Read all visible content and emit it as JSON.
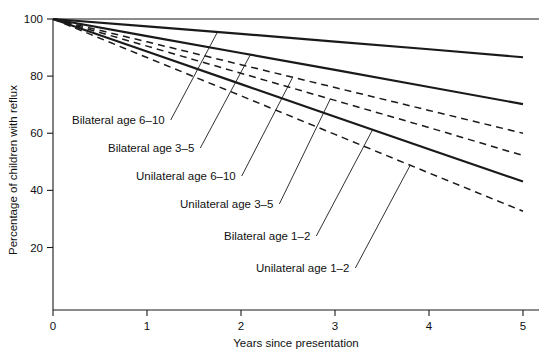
{
  "chart_data": {
    "type": "line",
    "title": "",
    "xlabel": "Years since presentation",
    "ylabel": "Percentage of children with reflux",
    "xlim": [
      0,
      5
    ],
    "ylim": [
      0,
      100
    ],
    "xticks": [
      "0",
      "1",
      "2",
      "3",
      "4",
      "5"
    ],
    "xtick_values": [
      0,
      1,
      2,
      3,
      4,
      5
    ],
    "yticks": [
      "20",
      "40",
      "60",
      "80",
      "100"
    ],
    "ytick_values": [
      20,
      40,
      60,
      80,
      100
    ],
    "grid": false,
    "legend_position": "inline-labels",
    "x": [
      0,
      1,
      2,
      3,
      4,
      5
    ],
    "series": [
      {
        "name": "Bilateral age 6-10",
        "label": "Bilateral age 6–10",
        "style": "solid",
        "color": "#1a1a1a",
        "values": [
          100,
          97.4,
          94.8,
          92.1,
          89.4,
          86.6
        ]
      },
      {
        "name": "Bilateral age 3-5",
        "label": "Bilateral age 3–5",
        "style": "solid",
        "color": "#1a1a1a",
        "values": [
          100,
          94.0,
          88.1,
          82.2,
          76.2,
          70.2
        ]
      },
      {
        "name": "Unilateral age 6-10",
        "label": "Unilateral age 6–10",
        "style": "dashed",
        "color": "#1a1a1a",
        "values": [
          100,
          92.0,
          84.0,
          76.0,
          68.0,
          60.0
        ]
      },
      {
        "name": "Unilateral age 3-5",
        "label": "Unilateral age 3–5",
        "style": "dashed",
        "color": "#1a1a1a",
        "values": [
          100,
          90.5,
          81.0,
          71.5,
          62.0,
          52.2
        ]
      },
      {
        "name": "Bilateral age 1-2",
        "label": "Bilateral age 1–2",
        "style": "solid",
        "color": "#1a1a1a",
        "values": [
          100,
          88.6,
          77.2,
          65.8,
          54.4,
          43.1
        ]
      },
      {
        "name": "Unilateral age 1-2",
        "label": "Unilateral age 1–2",
        "style": "dashed",
        "color": "#1a1a1a",
        "values": [
          100,
          86.5,
          73.1,
          59.6,
          46.1,
          32.7
        ]
      }
    ]
  },
  "axes": {
    "x_title": "Years since presentation",
    "y_title": "Percentage of children with reflux",
    "x_tick_labels": [
      "0",
      "1",
      "2",
      "3",
      "4",
      "5"
    ],
    "y_tick_labels": [
      "100",
      "80",
      "60",
      "40",
      "20"
    ]
  },
  "annotations": [
    {
      "id": "ann-bilateral-6-10",
      "text": "Bilateral age 6–10",
      "x": 72,
      "y": 124
    },
    {
      "id": "ann-bilateral-3-5",
      "text": "Bilateral age 3–5",
      "x": 108,
      "y": 152
    },
    {
      "id": "ann-unilateral-6-10",
      "text": "Unilateral age 6–10",
      "x": 136,
      "y": 180
    },
    {
      "id": "ann-unilateral-3-5",
      "text": "Unilateral age 3–5",
      "x": 180,
      "y": 208
    },
    {
      "id": "ann-bilateral-1-2",
      "text": "Bilateral age 1–2",
      "x": 224,
      "y": 240
    },
    {
      "id": "ann-unilateral-1-2",
      "text": "Unilateral age 1–2",
      "x": 256,
      "y": 272
    }
  ]
}
